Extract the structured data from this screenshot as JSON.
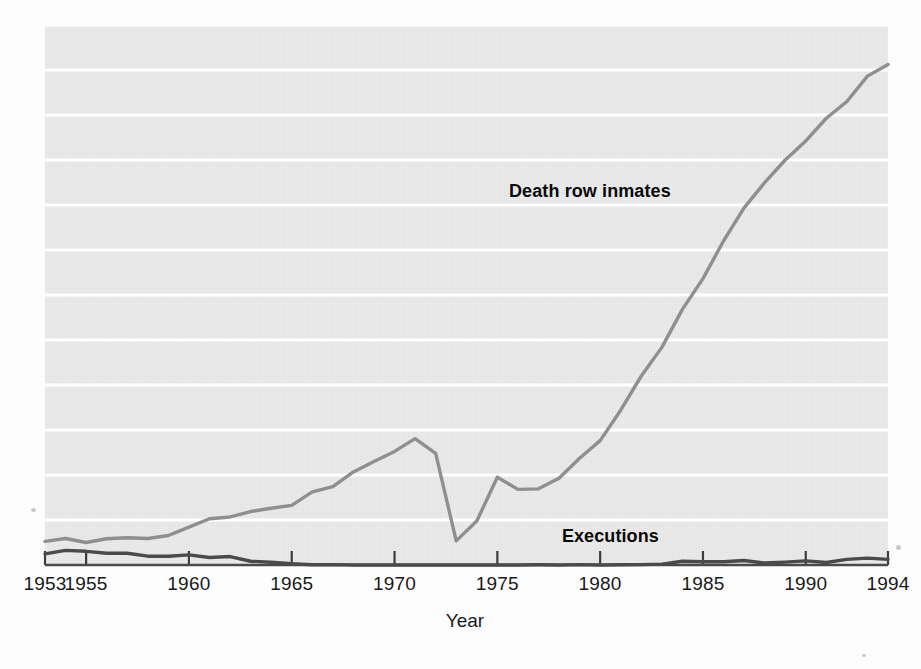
{
  "chart_data": {
    "type": "line",
    "title": "",
    "xlabel": "Year",
    "ylabel": "",
    "xlim": [
      1953,
      1994
    ],
    "ylim": [
      0,
      3000
    ],
    "grid": true,
    "grid_color": "#ffffff",
    "panel_color": "#ebebeb",
    "legend_position": "inline-annotation",
    "x_tick_labels": [
      "1953",
      "1955",
      "1960",
      "1965",
      "1970",
      "1975",
      "1980",
      "1985",
      "1990",
      "1994"
    ],
    "x_tick_values": [
      1953,
      1955,
      1960,
      1965,
      1970,
      1975,
      1980,
      1985,
      1990,
      1994
    ],
    "y_tick_labels": [
      "0",
      "250",
      "500",
      "750",
      "1,000",
      "1,250",
      "1,500",
      "1,750",
      "2,000",
      "2,250",
      "2,500",
      "2,750",
      "3,000"
    ],
    "y_tick_values": [
      0,
      250,
      500,
      750,
      1000,
      1250,
      1500,
      1750,
      2000,
      2250,
      2500,
      2750,
      3000
    ],
    "x": [
      1953,
      1954,
      1955,
      1956,
      1957,
      1958,
      1959,
      1960,
      1961,
      1962,
      1963,
      1964,
      1965,
      1966,
      1967,
      1968,
      1969,
      1970,
      1971,
      1972,
      1973,
      1974,
      1975,
      1976,
      1977,
      1978,
      1979,
      1980,
      1981,
      1982,
      1983,
      1984,
      1985,
      1986,
      1987,
      1988,
      1989,
      1990,
      1991,
      1992,
      1993,
      1994
    ],
    "series": [
      {
        "name": "Death row inmates",
        "color": "#8f8f8f",
        "label_x": 1979.5,
        "label_y": 2070,
        "values": [
          131,
          147,
          125,
          146,
          151,
          147,
          164,
          210,
          257,
          267,
          297,
          315,
          331,
          406,
          435,
          517,
          575,
          631,
          702,
          620,
          134,
          244,
          488,
          420,
          423,
          482,
          593,
          691,
          860,
          1050,
          1209,
          1420,
          1591,
          1800,
          1984,
          2124,
          2250,
          2356,
          2482,
          2575,
          2716,
          2780
        ]
      },
      {
        "name": "Executions",
        "color": "#4a4a4a",
        "label_x": 1980.5,
        "label_y": 155,
        "values": [
          62,
          81,
          76,
          65,
          65,
          49,
          49,
          56,
          42,
          47,
          21,
          15,
          7,
          1,
          2,
          0,
          0,
          0,
          0,
          0,
          0,
          0,
          0,
          0,
          1,
          0,
          2,
          0,
          1,
          2,
          5,
          21,
          18,
          18,
          25,
          11,
          16,
          23,
          14,
          31,
          38,
          31
        ]
      }
    ],
    "annotations": [
      {
        "text": "Death row inmates",
        "x": 1979.5,
        "y": 2070
      },
      {
        "text": "Executions",
        "x": 1980.5,
        "y": 155
      }
    ]
  },
  "axis": {
    "x_title": "Year"
  },
  "labels": {
    "death_row": "Death row inmates",
    "executions": "Executions"
  }
}
